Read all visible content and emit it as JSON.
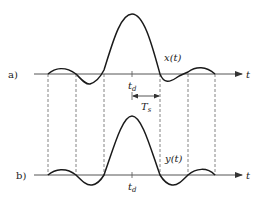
{
  "diagram": {
    "panel_a": {
      "label": "a)",
      "signal_label": "x(t)",
      "axis_label": "t",
      "center_label": "t",
      "center_sub": "d",
      "spacing_label": "T",
      "spacing_sub": "s"
    },
    "panel_b": {
      "label": "b)",
      "signal_label": "y(t)",
      "axis_label": "t",
      "center_label": "t",
      "center_sub": "d"
    },
    "colors": {
      "curve": "#1a1a1a",
      "axis": "#555555",
      "dashed": "#666666"
    }
  }
}
